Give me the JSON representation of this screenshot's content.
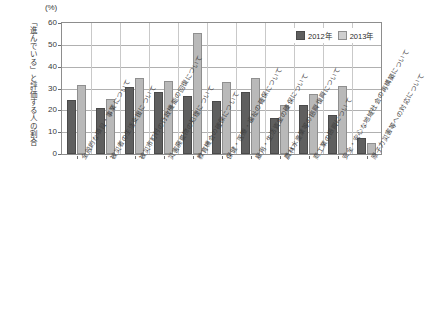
{
  "chart_data": {
    "type": "bar",
    "title": "",
    "subtitle": "",
    "unit_label": "(%)",
    "xlabel": "",
    "ylabel": "「進んでいる」と評価する人の割合",
    "ylim": [
      0,
      60
    ],
    "yticks": [
      0,
      10,
      20,
      30,
      40,
      50,
      60
    ],
    "ytick_labels": [
      "0",
      "10",
      "20",
      "30",
      "40",
      "50",
      "60"
    ],
    "grid": true,
    "legend_position": "top-right",
    "categories": [
      "全般的な項目・事業について",
      "被災者の生活支援について",
      "被災市町村の行政機能の回復について",
      "災害廃棄物の処理について",
      "教育機会の確保について",
      "保健・医療・福祉の確保について",
      "雇用・生活資金の確保について",
      "農林水産業等の振興復興について",
      "商工業の振興について",
      "安全・安心な地域社会の再構築について",
      "原子力災害等への対応について"
    ],
    "series": [
      {
        "name": "2012年",
        "color": "#5f5f5f",
        "values": [
          24.8,
          21.2,
          30.8,
          28.6,
          26.4,
          24.5,
          28.2,
          16.4,
          22.3,
          17.8,
          7.2
        ]
      },
      {
        "name": "2013年",
        "color": "#b9b9b9",
        "values": [
          31.4,
          25.3,
          34.7,
          33.4,
          55.6,
          33.2,
          35.0,
          22.4,
          27.5,
          31.1,
          5.2
        ]
      }
    ]
  }
}
